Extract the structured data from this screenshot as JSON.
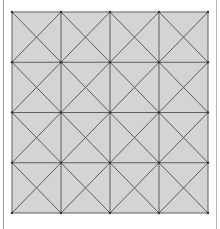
{
  "diagram": {
    "type": "grid-with-diagonals",
    "rows": 4,
    "cols": 4,
    "cell_pattern": "both-diagonals",
    "bounds": {
      "x0": 12,
      "y0": 12,
      "x1": 208,
      "y1": 213
    },
    "colors": {
      "fill": "#d4d4d4",
      "line": "#5e5e5e",
      "edge_left": "#9a9a9a",
      "edge_right": "#b5b5b5",
      "background": "#ffffff"
    },
    "line_width": 1
  }
}
